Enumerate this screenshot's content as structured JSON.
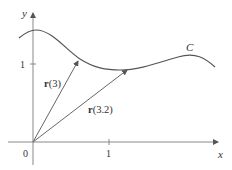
{
  "axes": {
    "x_label": "x",
    "y_label": "y",
    "origin_label": "0",
    "x_tick_label": "1",
    "y_tick_label": "1"
  },
  "curve": {
    "label": "C"
  },
  "vectors": [
    {
      "name": "r",
      "arg": "(3)"
    },
    {
      "name": "r",
      "arg": "(3.2)"
    }
  ],
  "colors": {
    "curve": "#444444",
    "axis": "#777777",
    "text": "#333333"
  }
}
